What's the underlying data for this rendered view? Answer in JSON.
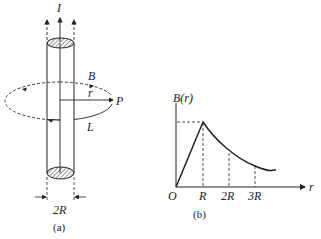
{
  "figure_a": {
    "current_label": "I",
    "field_label": "B",
    "radius_label": "r",
    "point_label": "P",
    "loop_label": "L",
    "diameter_label": "2R",
    "caption": "(a)"
  },
  "figure_b": {
    "y_axis_label": "B(r)",
    "x_axis_label": "r",
    "origin_label": "O",
    "ticks": [
      "R",
      "2R",
      "3R"
    ],
    "caption": "(b)"
  },
  "colors": {
    "ink": "#222222",
    "background": "#ffffff"
  }
}
